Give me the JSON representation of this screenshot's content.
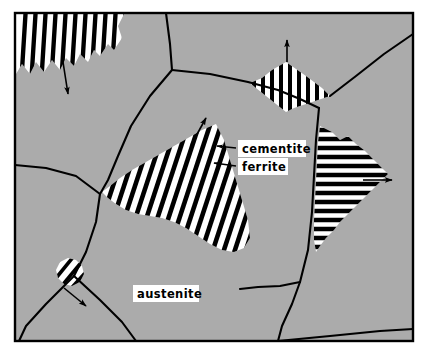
{
  "figure": {
    "frame": {
      "x": 14,
      "y": 12,
      "width": 400,
      "height": 330,
      "border_color": "#000000",
      "border_width": 2
    },
    "colors": {
      "austenite_gray": "#ABABAB",
      "ferrite_white": "#FFFFFF",
      "cementite_black": "#000000",
      "boundary_black": "#000000",
      "page_white": "#FFFFFF"
    }
  },
  "labels": [
    {
      "id": "cementite",
      "text": "cementite",
      "x": 243,
      "y": 149,
      "box_x": 238,
      "box_y": 141,
      "box_w": 66,
      "box_h": 16,
      "leader": {
        "x1": 236,
        "y1": 149,
        "x2": 218,
        "y2": 147
      }
    },
    {
      "id": "ferrite",
      "text": "ferrite",
      "x": 243,
      "y": 166,
      "box_x": 238,
      "box_y": 158,
      "box_w": 48,
      "box_h": 16,
      "leader": {
        "x1": 236,
        "y1": 166,
        "x2": 214,
        "y2": 163
      }
    },
    {
      "id": "austenite",
      "text": "austenite",
      "x": 138,
      "y": 293,
      "box_x": 133,
      "box_y": 285,
      "box_w": 64,
      "box_h": 16,
      "leader": null
    }
  ],
  "growth_arrows": [
    {
      "id": "arrow-top-left",
      "x1": 63,
      "y1": 62,
      "x2": 68,
      "y2": 96,
      "direction": "down"
    },
    {
      "id": "arrow-top-right",
      "x1": 287,
      "y1": 39,
      "x2": 287,
      "y2": 62,
      "direction": "up"
    },
    {
      "id": "arrow-center",
      "x1": 191,
      "y1": 145,
      "x2": 206,
      "y2": 117,
      "direction": "up-right"
    },
    {
      "id": "arrow-right",
      "x1": 363,
      "y1": 180,
      "x2": 394,
      "y2": 180,
      "direction": "right"
    },
    {
      "id": "arrow-bottom-left",
      "x1": 64,
      "y1": 288,
      "x2": 87,
      "y2": 307,
      "direction": "down-right"
    }
  ],
  "pearlite_colonies": [
    {
      "id": "colony-top-left",
      "lamellae_orientation_deg": 8,
      "lamellae_count": 12,
      "description": "Large colony at top-left growing downward with near-vertical lamellae and scalloped lower boundary"
    },
    {
      "id": "colony-top-right",
      "lamellae_orientation_deg": 0,
      "lamellae_count": 9,
      "description": "Diamond-shaped colony at top-right with vertical lamellae, growing upward"
    },
    {
      "id": "colony-center",
      "lamellae_orientation_deg": 20,
      "lamellae_count": 18,
      "description": "Large triangular colony in the centre with lamellae tilted 20 degrees, growing up-right"
    },
    {
      "id": "colony-right",
      "lamellae_orientation_deg": 90,
      "lamellae_count": 14,
      "description": "Colony at right with horizontal lamellae and jagged growth front, growing to the right"
    },
    {
      "id": "colony-bottom-left",
      "lamellae_orientation_deg": 40,
      "lamellae_count": 5,
      "description": "Small lens-shaped nucleus on grain boundary at lower-left, growing down-right"
    }
  ],
  "grain_boundaries": [
    {
      "id": "gb-top-center",
      "path": "M 166 12 L 170 44 L 172 70"
    },
    {
      "id": "gb-upper-left",
      "path": "M 172 70 L 150 96 L 131 126 L 118 156 L 108 180 L 100 194"
    },
    {
      "id": "gb-top-to-right",
      "path": "M 172 70 L 210 74 L 248 82 L 278 90 L 300 99 L 318 108"
    },
    {
      "id": "gb-left-horiz",
      "path": "M 14 165 L 46 168 L 76 176 L 100 194"
    },
    {
      "id": "gb-mid-down",
      "path": "M 100 194 L 96 222 L 86 254 L 74 276"
    },
    {
      "id": "gb-lower-left",
      "path": "M 74 276 L 46 304 L 26 326 L 18 342"
    },
    {
      "id": "gb-bottom-left",
      "path": "M 74 276 L 100 300 L 122 322 L 136 342"
    },
    {
      "id": "gb-right-upper",
      "path": "M 318 108 L 316 140 L 314 176 L 312 212 L 308 250 L 300 282"
    },
    {
      "id": "gb-diamond-rt",
      "path": "M 320 98 L 350 74 L 382 50 L 414 33"
    },
    {
      "id": "gb-bottom-mid",
      "path": "M 300 282 L 280 286 L 258 288 L 240 290"
    },
    {
      "id": "gb-bottom-down",
      "path": "M 300 282 L 292 304 L 282 326 L 278 342"
    },
    {
      "id": "gb-bottom-right",
      "path": "M 278 342 L 330 336 L 380 331 L 414 329"
    }
  ]
}
